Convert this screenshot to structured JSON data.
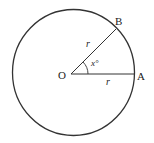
{
  "diagram": {
    "type": "circle-sector",
    "center_label": "O",
    "point_a_label": "A",
    "point_b_label": "B",
    "radius_label_ob": "r",
    "radius_label_oa": "r",
    "angle_label": "x°",
    "stroke_color": "#333333"
  }
}
